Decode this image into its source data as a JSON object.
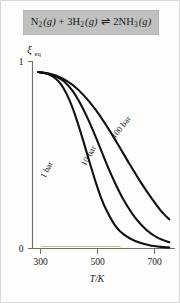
{
  "figure": {
    "background_color": "#fdfdfc",
    "border_color": "#d8d8d4"
  },
  "equation": {
    "banner_color": "#bfc1be",
    "full_text": "N2 (g) + 3H2 (g) ⇌ 2NH3 (g)",
    "reactant_1": "N",
    "reactant_1_sub": "2",
    "state_1": "(g)",
    "plus": "+",
    "reactant_2_coeff": "3",
    "reactant_2": "H",
    "reactant_2_sub": "2",
    "state_2": "(g)",
    "arrow": "⇌",
    "product_coeff": "2",
    "product": "NH",
    "product_sub": "3",
    "state_3": "(g)"
  },
  "chart_data": {
    "type": "line",
    "title": "",
    "xlabel": "T/K",
    "ylabel": "ξeq",
    "ylabel_symbol": "ξ",
    "ylabel_subscript": "eq",
    "xlim": [
      280,
      780
    ],
    "ylim": [
      0,
      1.06
    ],
    "xticks": [
      300,
      500,
      700
    ],
    "xticklabels": [
      "300",
      "500",
      "700"
    ],
    "yticks": [
      0,
      1
    ],
    "yticklabels": [
      "0",
      "1"
    ],
    "grid": false,
    "legend_position": "inline-curve-labels",
    "series": [
      {
        "name": "1 bar",
        "label": "1 bar",
        "color": "#111111",
        "x": [
          300,
          320,
          340,
          360,
          380,
          400,
          420,
          440,
          460,
          480,
          500,
          520,
          540,
          570,
          600,
          640,
          690,
          740,
          760
        ],
        "values": [
          1.0,
          0.995,
          0.985,
          0.965,
          0.93,
          0.875,
          0.8,
          0.705,
          0.6,
          0.49,
          0.385,
          0.29,
          0.215,
          0.13,
          0.08,
          0.042,
          0.018,
          0.008,
          0.006
        ]
      },
      {
        "name": "10 bar",
        "label": "10 bar",
        "color": "#111111",
        "x": [
          300,
          330,
          360,
          390,
          420,
          450,
          480,
          510,
          540,
          570,
          600,
          640,
          680,
          720,
          760
        ],
        "values": [
          1.0,
          0.993,
          0.978,
          0.948,
          0.895,
          0.815,
          0.715,
          0.6,
          0.48,
          0.37,
          0.275,
          0.175,
          0.105,
          0.06,
          0.036
        ]
      },
      {
        "name": "100 bar",
        "label": "100 bar",
        "color": "#111111",
        "x": [
          300,
          340,
          380,
          420,
          460,
          500,
          540,
          580,
          620,
          660,
          700,
          730,
          760
        ],
        "values": [
          1.0,
          0.99,
          0.968,
          0.928,
          0.868,
          0.79,
          0.695,
          0.59,
          0.48,
          0.375,
          0.28,
          0.215,
          0.165
        ]
      }
    ],
    "annotations": [
      {
        "text": "1 bar",
        "rotation": -62,
        "x_px": 48,
        "y_px": 168
      },
      {
        "text": "10 bar",
        "rotation": -60,
        "x_px": 88,
        "y_px": 155
      },
      {
        "text": "100 bar",
        "rotation": -51,
        "x_px": 118,
        "y_px": 128
      }
    ]
  }
}
